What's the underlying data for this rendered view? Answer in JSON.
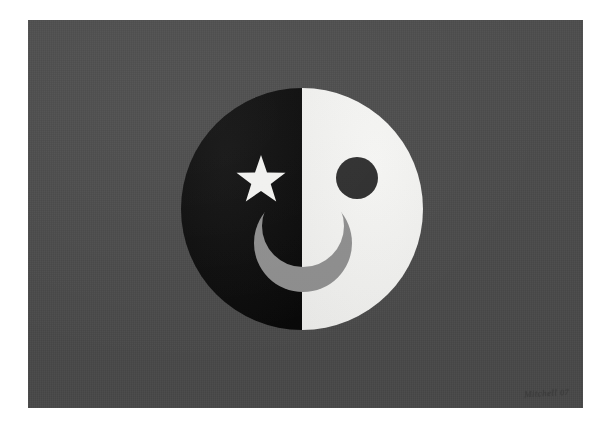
{
  "page": {
    "background_color": "#ffffff",
    "width": 612,
    "height": 429
  },
  "artwork": {
    "name": "Half black half white smiling face with star",
    "panel": {
      "background_color": "#4a4a4a",
      "left": 28,
      "top": 20,
      "width": 555,
      "height": 388
    },
    "palette": {
      "panel_gray": "#4a4a4a",
      "face_dark": "#0a0a0a",
      "face_light": "#f2f2f0",
      "eye_dark": "#2e2e2e",
      "smile_gray": "#8f8f8f",
      "star_white": "#f4f4f2"
    },
    "elements": [
      {
        "id": "face-circle",
        "label": "Face circle",
        "shape": "circle",
        "center_x": 302,
        "center_y": 209,
        "radius": 121,
        "description": "Large circle split vertically into a black left half and an off-white right half"
      },
      {
        "id": "face-left-half",
        "label": "Left half of face",
        "shape": "semicircle",
        "color": "#0a0a0a",
        "side": "left"
      },
      {
        "id": "face-right-half",
        "label": "Right half of face",
        "shape": "semicircle",
        "color": "#f2f2f0",
        "side": "right"
      },
      {
        "id": "star-eye",
        "label": "Star eye",
        "shape": "five-pointed-star",
        "color": "#f4f4f2",
        "center_x": 261,
        "center_y": 181,
        "outer_radius": 26,
        "points": 5,
        "description": "White five pointed star serving as the left eye on the black half"
      },
      {
        "id": "dot-eye",
        "label": "Dot eye",
        "shape": "circle",
        "color": "#2e2e2e",
        "center_x": 357,
        "center_y": 178,
        "radius": 21,
        "description": "Dark gray filled circle serving as the right eye on the white half"
      },
      {
        "id": "smile",
        "label": "Crescent smile",
        "shape": "crescent",
        "color": "#8f8f8f",
        "center_x": 303,
        "center_y": 243,
        "outer_radius": 49,
        "inner_radius": 41,
        "description": "Medium gray crescent moon shaped mouth spanning both halves of the face"
      }
    ]
  },
  "signature": {
    "text": "Mitchell",
    "year": "07",
    "medium": "pencil",
    "position": "bottom-right"
  }
}
